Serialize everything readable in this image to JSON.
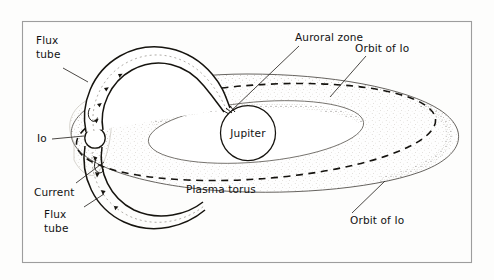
{
  "figure": {
    "kind": "scientific-diagram",
    "frame_color": "#9a9a9a",
    "ink_color": "#121212",
    "paper_color": "#fdfdfc",
    "stipple_color": "#b9b4ab"
  },
  "bodies": {
    "jupiter_label": "Jupiter",
    "io_label": "Io"
  },
  "labels": {
    "flux_tube_top_line1": "Flux",
    "flux_tube_top_line2": "tube",
    "auroral_zone": "Auroral zone",
    "orbit_of_io_top": "Orbit of Io",
    "orbit_of_io_bottom": "Orbit of Io",
    "plasma_torus": "Plasma torus",
    "current": "Current",
    "flux_tube_bottom_line1": "Flux",
    "flux_tube_bottom_line2": "tube"
  },
  "features": [
    {
      "name": "plasma-torus",
      "description": "Large stippled torus ring seen in perspective"
    },
    {
      "name": "io-orbit-dashed-ellipse",
      "description": "Dashed ellipse running through the torus"
    },
    {
      "name": "flux-tube-upper",
      "description": "Tube arc from Io over the top to Jupiter"
    },
    {
      "name": "flux-tube-lower",
      "description": "Tube arc from Io below curving to the right"
    },
    {
      "name": "current-arrows",
      "description": "Arrowheads inside the flux tubes showing current flow"
    },
    {
      "name": "auroral-zone-footprint",
      "description": "Point where flux tubes meet Jupiter's surface"
    }
  ]
}
